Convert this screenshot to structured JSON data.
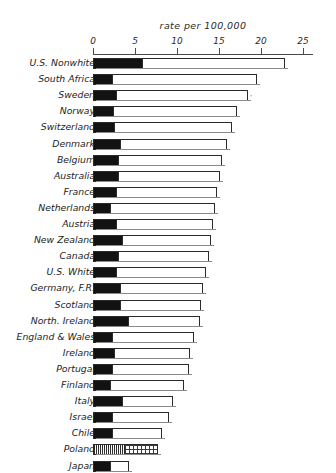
{
  "chart_data": {
    "type": "bar",
    "orientation": "horizontal",
    "title": "rate per 100,000",
    "xlabel": "rate per 100,000",
    "ylabel": "",
    "xlim": [
      0,
      25
    ],
    "xticks": [
      0,
      5,
      10,
      15,
      20,
      25
    ],
    "xtick_labels": [
      "0",
      "5",
      "10",
      "15",
      "20",
      "25"
    ],
    "grid": false,
    "legend": "none",
    "stacked": true,
    "series": [
      {
        "name": "dark segment",
        "values": [
          5.7,
          2.2,
          2.6,
          2.3,
          2.4,
          3.1,
          2.8,
          2.9,
          2.6,
          1.9,
          2.6,
          3.3,
          2.8,
          2.6,
          3.1,
          3.1,
          4.1,
          2.2,
          2.4,
          2.2,
          1.9,
          3.3,
          2.2,
          2.2,
          3.6,
          1.9
        ]
      },
      {
        "name": "light segment",
        "values": [
          17.2,
          17.3,
          15.9,
          14.9,
          14.2,
          12.9,
          12.5,
          12.2,
          12.2,
          12.6,
          11.7,
          10.8,
          11.0,
          10.8,
          10.0,
          9.8,
          8.6,
          9.8,
          9.2,
          9.2,
          8.9,
          6.2,
          6.9,
          6.0,
          4.1,
          2.4
        ]
      }
    ],
    "categories": [
      "U.S. Nonwhite",
      "South Africa",
      "Sweden",
      "Norway",
      "Switzerland",
      "Denmark",
      "Belgium",
      "Australia",
      "France",
      "Netherlands",
      "Austria",
      "New Zealand",
      "Canada",
      "U.S. White",
      "Germany, F.R.",
      "Scotland",
      "North. Ireland",
      "England & Wales",
      "Ireland",
      "Portugal",
      "Finland",
      "Italy",
      "Israel",
      "Chile",
      "Poland",
      "Japan"
    ],
    "totals": [
      22.9,
      19.5,
      18.5,
      17.2,
      16.6,
      16.0,
      15.3,
      15.1,
      14.8,
      14.5,
      14.3,
      14.1,
      13.8,
      13.4,
      13.1,
      12.9,
      12.7,
      12.0,
      11.6,
      11.4,
      10.8,
      9.5,
      9.1,
      8.2,
      7.7,
      4.3
    ],
    "bars": [
      {
        "label": "U.S. Nonwhite",
        "dark": 5.7,
        "total": 22.9,
        "pattern": "solid"
      },
      {
        "label": "South Africa",
        "dark": 2.2,
        "total": 19.5,
        "pattern": "solid"
      },
      {
        "label": "Sweden",
        "dark": 2.6,
        "total": 18.5,
        "pattern": "solid"
      },
      {
        "label": "Norway",
        "dark": 2.3,
        "total": 17.2,
        "pattern": "solid"
      },
      {
        "label": "Switzerland",
        "dark": 2.4,
        "total": 16.6,
        "pattern": "solid"
      },
      {
        "label": "Denmark",
        "dark": 3.1,
        "total": 16.0,
        "pattern": "solid"
      },
      {
        "label": "Belgium",
        "dark": 2.8,
        "total": 15.3,
        "pattern": "solid"
      },
      {
        "label": "Australia",
        "dark": 2.9,
        "total": 15.1,
        "pattern": "solid"
      },
      {
        "label": "France",
        "dark": 2.6,
        "total": 14.8,
        "pattern": "solid"
      },
      {
        "label": "Netherlands",
        "dark": 1.9,
        "total": 14.5,
        "pattern": "solid"
      },
      {
        "label": "Austria",
        "dark": 2.6,
        "total": 14.3,
        "pattern": "solid"
      },
      {
        "label": "New Zealand",
        "dark": 3.3,
        "total": 14.1,
        "pattern": "solid"
      },
      {
        "label": "Canada",
        "dark": 2.8,
        "total": 13.8,
        "pattern": "solid"
      },
      {
        "label": "U.S. White",
        "dark": 2.6,
        "total": 13.4,
        "pattern": "solid"
      },
      {
        "label": "Germany, F.R.",
        "dark": 3.1,
        "total": 13.1,
        "pattern": "solid"
      },
      {
        "label": "Scotland",
        "dark": 3.1,
        "total": 12.9,
        "pattern": "solid"
      },
      {
        "label": "North. Ireland",
        "dark": 4.1,
        "total": 12.7,
        "pattern": "solid"
      },
      {
        "label": "England & Wales",
        "dark": 2.2,
        "total": 12.0,
        "pattern": "solid"
      },
      {
        "label": "Ireland",
        "dark": 2.4,
        "total": 11.6,
        "pattern": "solid"
      },
      {
        "label": "Portugal",
        "dark": 2.2,
        "total": 11.4,
        "pattern": "solid"
      },
      {
        "label": "Finland",
        "dark": 1.9,
        "total": 10.8,
        "pattern": "solid"
      },
      {
        "label": "Italy",
        "dark": 3.3,
        "total": 9.5,
        "pattern": "solid"
      },
      {
        "label": "Israel",
        "dark": 2.2,
        "total": 9.1,
        "pattern": "solid"
      },
      {
        "label": "Chile",
        "dark": 2.2,
        "total": 8.2,
        "pattern": "solid"
      },
      {
        "label": "Poland",
        "dark": 3.6,
        "total": 7.7,
        "pattern": "hatched"
      },
      {
        "label": "Japan",
        "dark": 1.9,
        "total": 4.3,
        "pattern": "solid"
      }
    ]
  },
  "colors": {
    "ink": "#2b2b2b",
    "dark_segment": "#121212",
    "light_segment": "#ffffff",
    "background": "#ffffff"
  },
  "annotations": {
    "stray_tick_mark": "'"
  }
}
